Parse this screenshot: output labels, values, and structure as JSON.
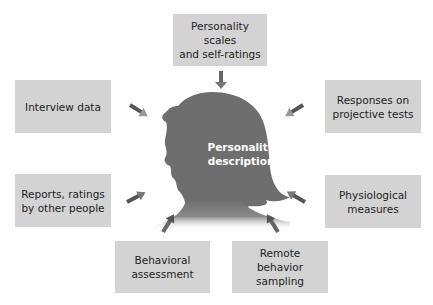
{
  "diagram": {
    "center": {
      "label": "Personality\ndescription",
      "shape": "female head silhouette"
    },
    "sources": [
      {
        "id": "scales",
        "label": "Personality scales\nand self-ratings",
        "position": "top"
      },
      {
        "id": "interview",
        "label": "Interview data",
        "position": "upper-left"
      },
      {
        "id": "projective",
        "label": "Responses on\nprojective tests",
        "position": "upper-right"
      },
      {
        "id": "reports",
        "label": "Reports, ratings\nby other people",
        "position": "lower-left"
      },
      {
        "id": "physiological",
        "label": "Physiological\nmeasures",
        "position": "lower-right"
      },
      {
        "id": "behavioral",
        "label": "Behavioral\nassessment",
        "position": "bottom-left"
      },
      {
        "id": "remote",
        "label": "Remote\nbehavior\nsampling",
        "position": "bottom-right"
      }
    ],
    "colors": {
      "box_fill": "#d3d3d3",
      "silhouette": "#6e6e6e",
      "arrow": "#6a6a6a",
      "center_text": "#ffffff",
      "box_text": "#222222"
    }
  }
}
